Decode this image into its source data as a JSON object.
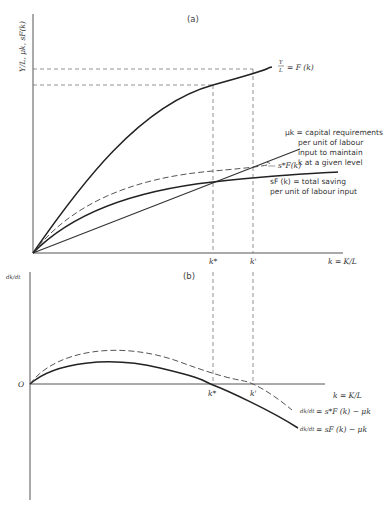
{
  "panel_a": {
    "label": "(a)",
    "y_axis_label": "Y/L, μk, sF(k)",
    "x_axis_label": "k = K/L",
    "tick_k_star": "k*",
    "tick_k_prime": "k'",
    "curves": {
      "production": {
        "label": "Y/L = F(k)",
        "label_num": "Y",
        "label_den": "L",
        "label_rest": "= F (k)"
      },
      "s_star": {
        "label": "— s*F(k)"
      },
      "capital_req": {
        "label_lines": [
          "μk = capital requirements",
          "per unit of labour",
          "input to maintain",
          "k at a given level"
        ]
      },
      "saving": {
        "label_lines": [
          "sF (k) = total saving",
          "per unit of labour input"
        ]
      }
    }
  },
  "panel_b": {
    "label": "(b)",
    "y_axis_label": "dk/dt",
    "origin_label": "O",
    "x_axis_label": "k = K/L",
    "tick_k_star": "k*",
    "tick_k_prime": "k'",
    "curves": {
      "s_star": {
        "label_frac": "dk/dt",
        "label_rest": "= s*F (k) − μk"
      },
      "s": {
        "label_frac": "dk/dt",
        "label_rest": "= sF (k) − μk"
      }
    }
  }
}
